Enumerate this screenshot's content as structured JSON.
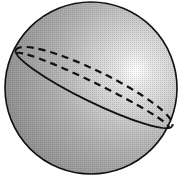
{
  "diagram": {
    "title": "Sphere with great circle",
    "shapes": {
      "sphere": {
        "cx": 91,
        "cy": 88,
        "r": 86,
        "fill_light": "#f4f4f4",
        "fill_dark": "#8c8c8c",
        "stroke": "#111111"
      },
      "highlight": {
        "cx": 140,
        "cy": 72
      },
      "ellipse_front": {
        "style": "solid",
        "stroke": "#111111"
      },
      "ellipse_back_outer": {
        "style": "dashed",
        "stroke": "#111111"
      },
      "ellipse_back_inner": {
        "style": "dashed",
        "stroke": "#111111"
      }
    }
  }
}
